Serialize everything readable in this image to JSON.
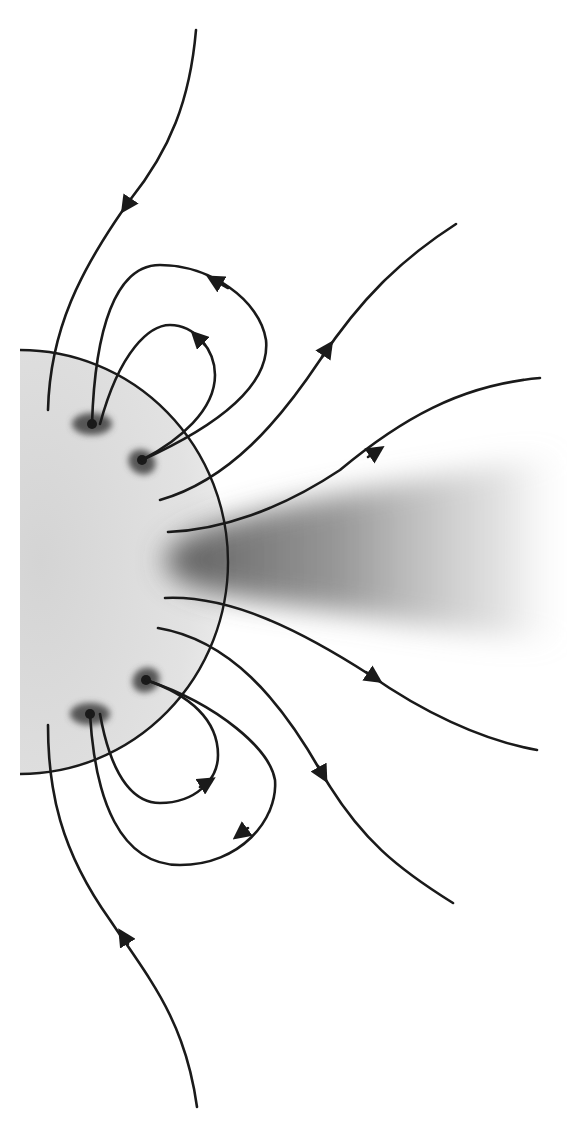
{
  "figure": {
    "colors": {
      "background": "#ffffff",
      "disk_fill": "#dcdcdc",
      "line": "#1a1a1a",
      "streamer": "#6e6e6e",
      "spot": "#3a3a3a"
    },
    "disk": {
      "cx": 20,
      "cy": 562,
      "rx": 208,
      "ry": 212
    },
    "sunspots": [
      {
        "name": "upper-outer",
        "cx": 92,
        "cy": 424,
        "rx": 20,
        "ry": 11
      },
      {
        "name": "upper-inner",
        "cx": 142,
        "cy": 462,
        "rx": 16,
        "ry": 12
      },
      {
        "name": "lower-inner",
        "cx": 146,
        "cy": 680,
        "rx": 16,
        "ry": 12
      },
      {
        "name": "lower-outer",
        "cx": 90,
        "cy": 714,
        "rx": 20,
        "ry": 11
      }
    ],
    "field_lines": [
      {
        "name": "open-top",
        "direction": "inward"
      },
      {
        "name": "loop-upper-large",
        "direction": "toward-outer-spot"
      },
      {
        "name": "loop-upper-small",
        "direction": "toward-outer-spot"
      },
      {
        "name": "open-upper-right-1",
        "direction": "outward"
      },
      {
        "name": "open-upper-right-2",
        "direction": "inward"
      },
      {
        "name": "open-lower-right-1",
        "direction": "outward"
      },
      {
        "name": "open-lower-right-2",
        "direction": "outward"
      },
      {
        "name": "loop-lower-small",
        "direction": "toward-inner-spot"
      },
      {
        "name": "loop-lower-large",
        "direction": "toward-inner-spot"
      },
      {
        "name": "open-bottom",
        "direction": "inward"
      }
    ],
    "labels": []
  }
}
